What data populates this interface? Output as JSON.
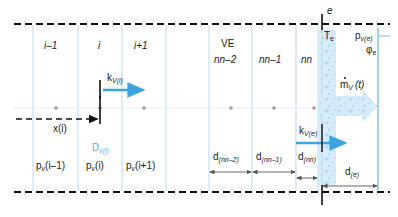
{
  "figure": {
    "type": "schematic-diagram",
    "colors": {
      "grid_blue": "#bcd9ef",
      "accent_blue": "#3aa3e0",
      "label_blue": "#6aa8d8",
      "boundary_black": "#111111",
      "dimension_gray": "#555555",
      "water_fill": "#cfe8f7"
    }
  },
  "node_labels": {
    "i_minus_1": "i–1",
    "i": "i",
    "i_plus_1": "i+1",
    "ve": "VE",
    "nn_minus_2": "nn–2",
    "nn_minus_1": "nn–1",
    "nn": "nn"
  },
  "pressure_labels": {
    "p_v_i_minus_1": {
      "base": "p",
      "sub": "v",
      "arg": "(i–1)"
    },
    "p_v_i": {
      "base": "p",
      "sub": "v",
      "arg": "(i)"
    },
    "p_v_i_plus_1": {
      "base": "p",
      "sub": "v",
      "arg": "(i+1)"
    },
    "p_v_e": {
      "base": "p",
      "sub": "v(e)"
    }
  },
  "flux_labels": {
    "k_v_i": {
      "base": "k",
      "sub": "V(i)"
    },
    "k_v_e": {
      "base": "k",
      "sub": "V(e)"
    },
    "d_v_i": {
      "base": "D",
      "sub": "v(i)"
    },
    "m_dot_v_t": {
      "base": "m",
      "sub": "V",
      "arg": "(t)"
    }
  },
  "boundary_labels": {
    "e": "e",
    "T_e": {
      "base": "T",
      "sub": "e"
    },
    "phi_e": {
      "base": "φ",
      "sub": "e"
    }
  },
  "position_labels": {
    "x_i": {
      "base": "x",
      "arg": "(i)"
    }
  },
  "dimension_labels": {
    "d_nn_minus_2": {
      "base": "d",
      "sub": "(nn–2)"
    },
    "d_nn_minus_1": {
      "base": "d",
      "sub": "(nn–1)"
    },
    "d_nn": {
      "base": "d",
      "sub": "(nn)"
    },
    "d_e": {
      "base": "d",
      "sub": "(e)"
    }
  }
}
